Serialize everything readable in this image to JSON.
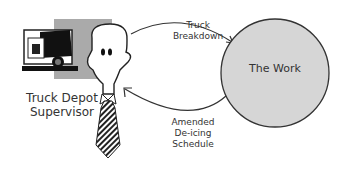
{
  "diagram": {
    "actor": {
      "label_line1": "Truck Depot",
      "label_line2": "Supervisor",
      "icon": "person-with-tie"
    },
    "illustration": "dump-truck",
    "node": {
      "label": "The Work",
      "fill": "#d6d6d6",
      "stroke": "#333333"
    },
    "edges": [
      {
        "from": "The Work",
        "to": "Truck Depot Supervisor",
        "label_line1": "Truck",
        "label_line2": "Breakdown",
        "direction": "to-node"
      },
      {
        "from": "The Work",
        "to": "Truck Depot Supervisor",
        "label_line1": "Amended",
        "label_line2": "De-icing",
        "label_line3": "Schedule",
        "direction": "to-actor"
      }
    ]
  }
}
